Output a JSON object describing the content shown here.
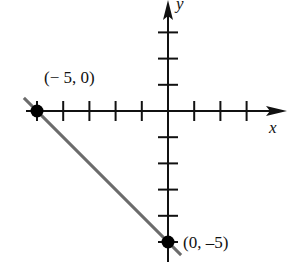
{
  "chart_data": {
    "type": "line",
    "title": "",
    "xlabel": "x",
    "ylabel": "y",
    "xlim": [
      -6.2,
      4.9
    ],
    "ylim": [
      -6.2,
      4.3
    ],
    "grid": false,
    "tick_spacing": 1,
    "x_ticks": [
      -5,
      -4,
      -3,
      -2,
      -1,
      1,
      2,
      3
    ],
    "y_ticks": [
      -5,
      -4,
      -3,
      -2,
      -1,
      1,
      2,
      3
    ],
    "series": [
      {
        "name": "line",
        "color": "#6b6b6b",
        "x": [
          -5.5,
          0.5
        ],
        "y": [
          0.5,
          -5.5
        ]
      }
    ],
    "points": [
      {
        "x": -5,
        "y": 0,
        "label": "(−5, 0)"
      },
      {
        "x": 0,
        "y": -5,
        "label": "(0, −5)"
      }
    ],
    "annotations": [
      "(−5, 0)",
      "(0, −5)"
    ]
  },
  "labels": {
    "x_axis": "x",
    "y_axis": "y",
    "point_a": "(− 5, 0)",
    "point_b": "(0, –5)"
  },
  "colors": {
    "axis": "#111111",
    "line": "#6b6b6b",
    "point": "#000000"
  }
}
